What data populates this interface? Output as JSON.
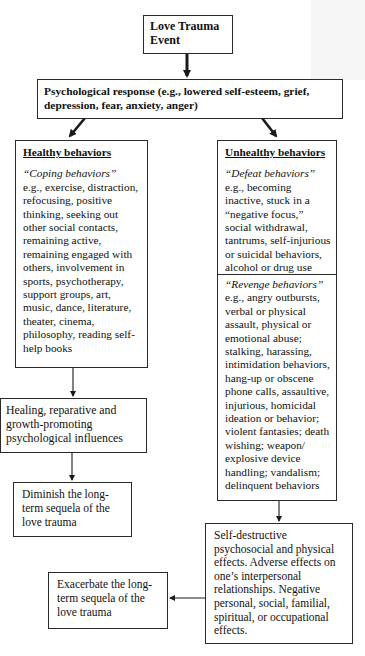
{
  "diagram": {
    "nodes": {
      "event": {
        "label": "Love Trauma Event"
      },
      "response": {
        "label": "Psychological response (e.g., lowered self-esteem, grief, depression, fear, anxiety, anger)"
      },
      "healthy": {
        "heading": "Healthy behaviors",
        "subheading": "“Coping behaviors”",
        "text": "e.g., exercise, distraction, refocusing, positive thinking, seeking out other social contacts, remaining active, remaining engaged with others, involvement in sports, psychotherapy, support groups, art, music, dance, literature, theater, cinema, philosophy, reading self-help books"
      },
      "unhealthy": {
        "heading": "Unhealthy behaviors",
        "defeat": {
          "subheading": "“Defeat behaviors”",
          "text": "e.g., becoming inactive, stuck in a “negative focus,” social withdrawal, tantrums, self-injurious or suicidal behaviors, alcohol or drug use"
        },
        "revenge": {
          "subheading": "“Revenge behaviors”",
          "text": "e.g., angry outbursts, verbal or physical assault, physical or emotional abuse; stalking, harassing, intimidation behaviors, hang-up or obscene phone calls, assaultive, injurious, homicidal ideation or behavior; violent fantasies; death wishing; weapon/ explosive device handling; vandalism; delinquent behaviors"
        }
      },
      "healing": {
        "label": "Healing, reparative and growth-promoting psychological influences"
      },
      "diminish": {
        "label": "Diminish the long-term sequela of the love trauma"
      },
      "self_destructive": {
        "label": "Self-destructive psychosocial and physical effects. Adverse effects on one’s interpersonal relationships. Negative personal, social, familial, spiritual, or occupational effects."
      },
      "exacerbate": {
        "label": "Exacerbate the long-term sequela of the love trauma"
      }
    },
    "edges": [
      {
        "from": "event",
        "to": "response"
      },
      {
        "from": "response",
        "to": "healthy"
      },
      {
        "from": "response",
        "to": "unhealthy"
      },
      {
        "from": "healthy",
        "to": "healing"
      },
      {
        "from": "healing",
        "to": "diminish"
      },
      {
        "from": "unhealthy",
        "to": "self_destructive"
      },
      {
        "from": "self_destructive",
        "to": "exacerbate"
      }
    ],
    "colors": {
      "line": "#1a1a1a",
      "box_border": "#2a2a2a",
      "background": "#ffffff"
    }
  }
}
